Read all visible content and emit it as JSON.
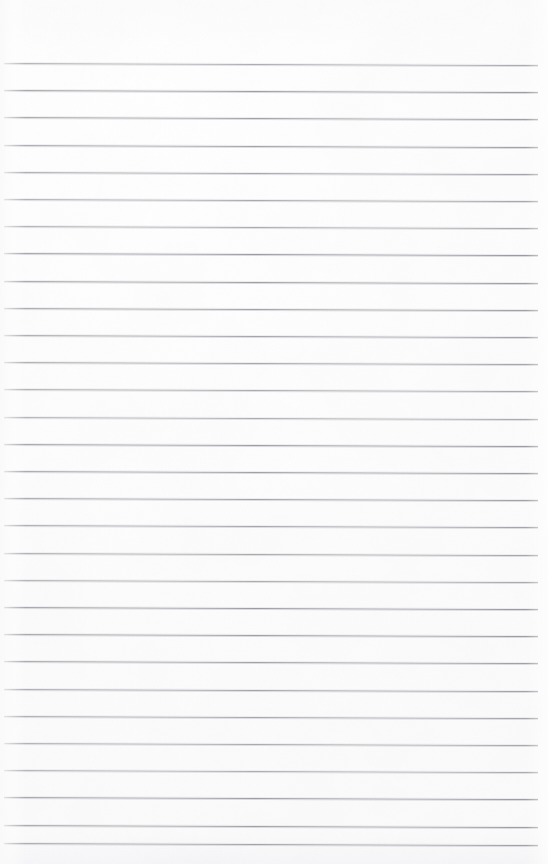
{
  "document": {
    "kind": "scanned-page",
    "content_type": "blank-ruled-notebook-paper",
    "visible_text": "",
    "page_width_px": 548,
    "page_height_px": 864,
    "background_color": "#fdfdfd",
    "edge_shade_color": "#aaacb2"
  },
  "ruling": {
    "line_color": "#9b9ba1",
    "line_halo_color": "#cfcfd4",
    "line_thickness_px": 1,
    "line_spacing_px": 27.2,
    "first_line_y_px": 63,
    "line_left_x_px": 4,
    "line_right_x_px": 538,
    "skew_px_over_width": 2,
    "line_count": 30,
    "line_y_positions_px": [
      63,
      90.2,
      117.4,
      144.6,
      171.8,
      199,
      226.2,
      253.4,
      280.6,
      307.8,
      335,
      362.2,
      389.4,
      416.6,
      443.8,
      471,
      498.2,
      525.4,
      552.6,
      579.8,
      607,
      634.2,
      661.4,
      688.6,
      715.8,
      743,
      770.2,
      797.4,
      824.6,
      843
    ]
  },
  "margins": {
    "top_blank_band_px": 63,
    "left_margin_px": 4,
    "right_margin_px": 10,
    "bottom_blank_band_px": 21
  },
  "annotations": {
    "handwriting_present": false,
    "printed_text_present": false,
    "margin_rule_present": false,
    "hole_punches_present": false
  }
}
